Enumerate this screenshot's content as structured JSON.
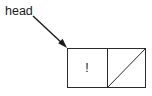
{
  "canvas": {
    "width": 152,
    "height": 96,
    "background_color": "#ffffff",
    "stroke_color": "#2b2b2b",
    "text_color": "#1a1a1a"
  },
  "diagram": {
    "type": "linked-list-node",
    "pointer": {
      "label": "head",
      "label_x": 5,
      "label_y": 15,
      "arrow": {
        "from_x": 33,
        "from_y": 16,
        "to_x": 67,
        "to_y": 48
      }
    },
    "node": {
      "x": 67,
      "y": 48,
      "width": 79,
      "height": 40,
      "divider_x": 107,
      "data_cell": {
        "value": "!",
        "center_x": 87,
        "center_y": 68
      },
      "next_cell": {
        "value": "",
        "is_null": true,
        "slash_x1": 107,
        "slash_y1": 88,
        "slash_x2": 146,
        "slash_y2": 48
      }
    }
  }
}
